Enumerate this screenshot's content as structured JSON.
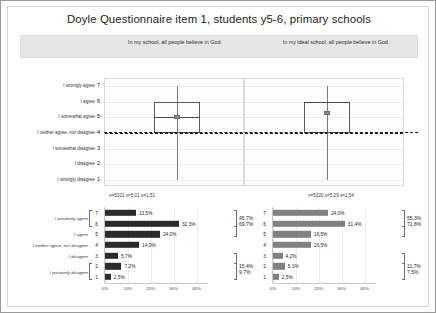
{
  "figure": {
    "title": "Doyle Questionnaire item 1, students y5-6, primary schools"
  },
  "panels": {
    "left": {
      "subtitle": "In my school, all people believe in God.",
      "stats_label": "n=5321 x=5,01 s=1,51",
      "bar_color": "#2b2b2b"
    },
    "right": {
      "subtitle": "In my ideal school, all people believe in God.",
      "stats_label": "n=5320 x=5,29 s=1,54",
      "bar_color": "#808080"
    }
  },
  "scale": {
    "labels": [
      {
        "num": "7",
        "text": "I strongly agree"
      },
      {
        "num": "6",
        "text": "I agree"
      },
      {
        "num": "5",
        "text": "I somewhat agree"
      },
      {
        "num": "4",
        "text": "I neither agree, nor disagree"
      },
      {
        "num": "3",
        "text": "I somewhat disagree"
      },
      {
        "num": "2",
        "text": "I disagree"
      },
      {
        "num": "1",
        "text": "I strongly disagree"
      }
    ]
  },
  "bar_categories": {
    "groups": [
      {
        "label": "I positively agree",
        "nums": [
          "7",
          "6"
        ]
      },
      {
        "label": "I agree",
        "nums": [
          "5"
        ]
      },
      {
        "label": "I neither agree, nor disagree",
        "nums": [
          "4"
        ]
      },
      {
        "label": "I disagree",
        "nums": [
          "3"
        ]
      },
      {
        "label": "I positively disagree",
        "nums": [
          "2",
          "1"
        ]
      }
    ],
    "numbers": [
      "7",
      "6",
      "5",
      "4",
      "3",
      "2",
      "1"
    ]
  },
  "xaxis": {
    "ticks": [
      "0%",
      "10%",
      "20%",
      "30%",
      "40%"
    ]
  },
  "chart_data": [
    {
      "type": "boxplot",
      "panel": "left",
      "title": "In my school, all people believe in God.",
      "ylabel": "",
      "ylim": [
        1,
        7
      ],
      "n": 5321,
      "mean": 5.01,
      "sd": 1.51,
      "whisker_low": 1,
      "q1": 4,
      "median": 5,
      "q3": 6,
      "whisker_high": 7,
      "reference_line": 4,
      "annotation": "n=5321 x=5,01 s=1,51"
    },
    {
      "type": "boxplot",
      "panel": "right",
      "title": "In my ideal school, all people believe in God.",
      "ylabel": "",
      "ylim": [
        1,
        7
      ],
      "n": 5320,
      "mean": 5.29,
      "sd": 1.54,
      "whisker_low": 1,
      "q1": 4,
      "median": 6,
      "q3": 6,
      "whisker_high": 7,
      "reference_line": 4,
      "annotation": "n=5320 x=5,29 s=1,54"
    },
    {
      "type": "bar",
      "orientation": "horizontal",
      "panel": "left",
      "title": "In my school, all people believe in God.",
      "categories": [
        "7",
        "6",
        "5",
        "4",
        "3",
        "2",
        "1"
      ],
      "values": [
        13.5,
        32.3,
        24.0,
        14.9,
        5.7,
        7.2,
        2.5
      ],
      "value_labels": [
        "13,5%",
        "32,3%",
        "24,0%",
        "14,9%",
        "5,7%",
        "7,2%",
        "2,5%"
      ],
      "xlabel": "",
      "ylabel": "",
      "xlim": [
        0,
        45
      ],
      "xticks": [
        "0%",
        "10%",
        "20%",
        "30%",
        "40%"
      ],
      "grid": true,
      "summaries": [
        {
          "label": "45,7%",
          "covers": [
            "7",
            "6"
          ]
        },
        {
          "label": "69,7%",
          "covers": [
            "7",
            "6",
            "5"
          ]
        },
        {
          "label": "15,4%",
          "covers": [
            "3",
            "2",
            "1"
          ]
        },
        {
          "label": "9,7%",
          "covers": [
            "2",
            "1"
          ]
        }
      ]
    },
    {
      "type": "bar",
      "orientation": "horizontal",
      "panel": "right",
      "title": "In my ideal school, all people believe in God.",
      "categories": [
        "7",
        "6",
        "5",
        "4",
        "3",
        "2",
        "1"
      ],
      "values": [
        24.0,
        31.4,
        16.5,
        16.5,
        4.2,
        5.1,
        2.5
      ],
      "value_labels": [
        "24,0%",
        "31,4%",
        "16,5%",
        "16,5%",
        "4,2%",
        "5,1%",
        "2,5%"
      ],
      "xlabel": "",
      "ylabel": "",
      "xlim": [
        0,
        45
      ],
      "xticks": [
        "0%",
        "10%",
        "20%",
        "30%",
        "40%"
      ],
      "grid": true,
      "summaries": [
        {
          "label": "55,3%",
          "covers": [
            "7",
            "6"
          ]
        },
        {
          "label": "71,8%",
          "covers": [
            "7",
            "6",
            "5"
          ]
        },
        {
          "label": "11,7%",
          "covers": [
            "3",
            "2",
            "1"
          ]
        },
        {
          "label": "7,5%",
          "covers": [
            "2",
            "1"
          ]
        }
      ]
    }
  ]
}
